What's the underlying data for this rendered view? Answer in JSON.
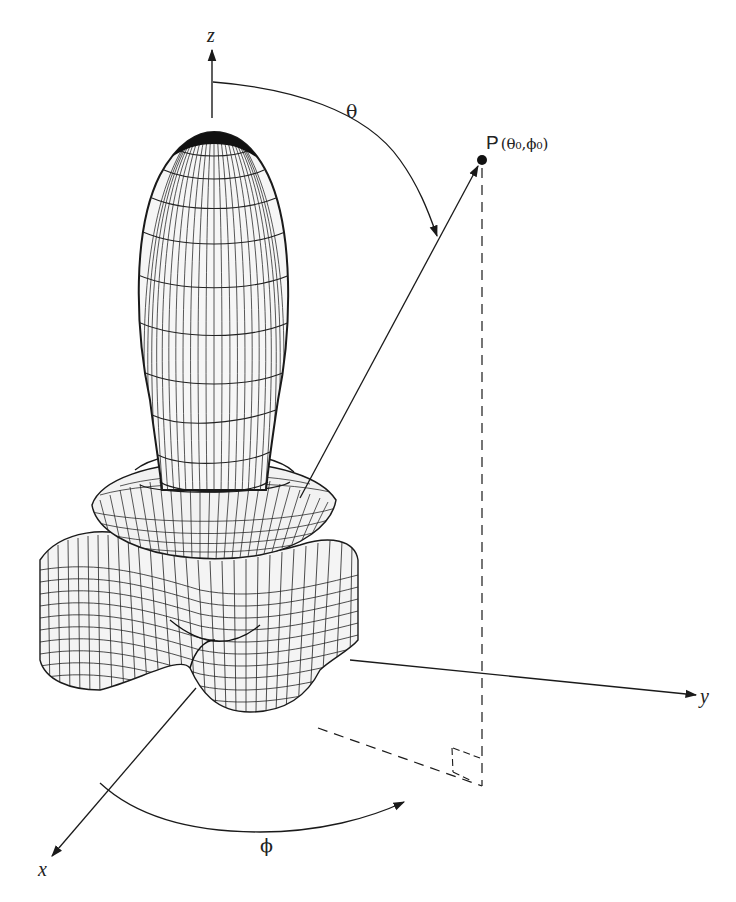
{
  "figure": {
    "axes": {
      "z_label": "z",
      "y_label": "y",
      "x_label": "x"
    },
    "angles": {
      "theta_label": "θ",
      "phi_label": "ϕ"
    },
    "point": {
      "label": "P(θ₀,ϕ₀)",
      "label_main": "P",
      "label_args": "(θ₀,ϕ₀)"
    },
    "colors": {
      "line": "#1a1a1a",
      "mesh": "#222222",
      "background": "#ffffff"
    }
  }
}
